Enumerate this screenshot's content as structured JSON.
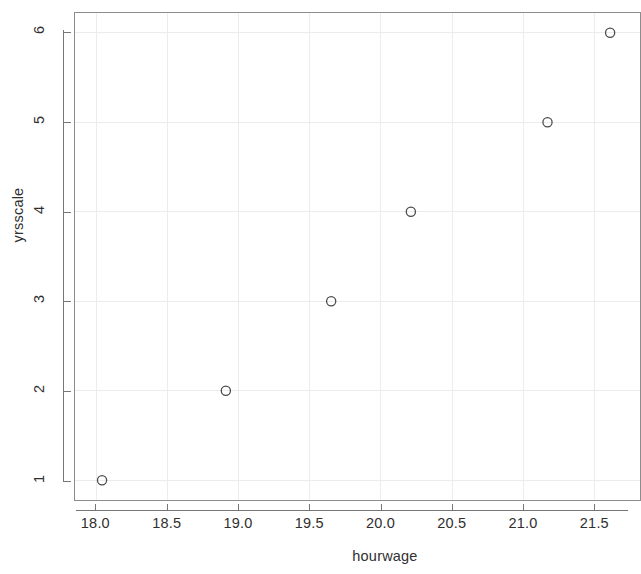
{
  "chart_data": {
    "type": "scatter",
    "title": "",
    "xlabel": "hourwage",
    "ylabel": "yrsscale",
    "xlim": [
      17.85,
      21.82
    ],
    "ylim": [
      0.78,
      6.22
    ],
    "grid": true,
    "legend": null,
    "marker": "open-circle",
    "x": [
      18.04,
      18.91,
      19.65,
      20.21,
      21.17,
      21.61
    ],
    "y": [
      1,
      2,
      3,
      4,
      5,
      6
    ],
    "points": [
      {
        "x": 18.04,
        "y": 1
      },
      {
        "x": 18.91,
        "y": 2
      },
      {
        "x": 19.65,
        "y": 3
      },
      {
        "x": 20.21,
        "y": 4
      },
      {
        "x": 21.17,
        "y": 5
      },
      {
        "x": 21.61,
        "y": 6
      }
    ],
    "xticks": [
      18.0,
      18.5,
      19.0,
      19.5,
      20.0,
      20.5,
      21.0,
      21.5
    ],
    "xticklabels": [
      "18.0",
      "18.5",
      "19.0",
      "19.5",
      "20.0",
      "20.5",
      "21.0",
      "21.5"
    ],
    "yticks": [
      1,
      2,
      3,
      4,
      5,
      6
    ],
    "yticklabels": [
      "1",
      "2",
      "3",
      "4",
      "5",
      "6"
    ],
    "colors": {
      "background": "#ffffff",
      "axis": "#767676",
      "panel_border": "#8c8c8c",
      "grid": "#ececed",
      "marker": "#4a4a4a",
      "text": "#2f2f2f"
    }
  }
}
